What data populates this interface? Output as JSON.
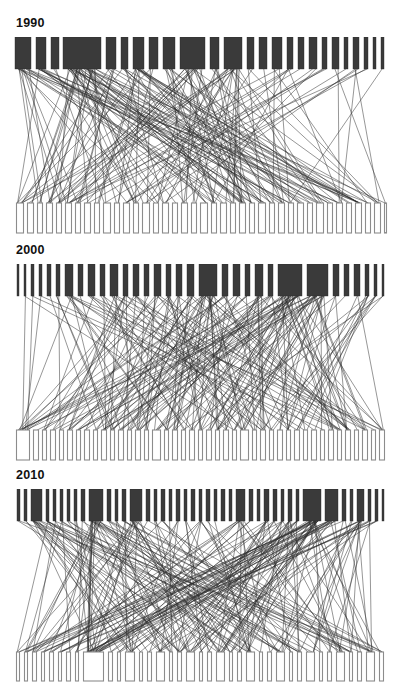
{
  "figure": {
    "title": "",
    "background_color": "#ffffff",
    "width": 400,
    "height": 683,
    "node_top_color": "#3a3a3a",
    "node_bottom_color": "#ffffff",
    "node_bottom_stroke": "#8c8c8c",
    "link_color": "#2f2f2f"
  },
  "chart_data": {
    "type": "diagram",
    "subtype": "bipartite-network",
    "title": "",
    "xlabel": "",
    "ylabel": "",
    "grid": false,
    "legend": null,
    "panel_labels": [
      "1990",
      "2000",
      "2010"
    ],
    "panels": [
      {
        "label": "1990",
        "label_x": 16,
        "label_y": 16,
        "plot": {
          "x": 15,
          "y": 37,
          "width": 371,
          "height": 196
        },
        "top_row": {
          "y": 37,
          "height": 32
        },
        "bottom_row": {
          "y": 203,
          "height": 30
        },
        "top_nodes": [
          {
            "x": 15,
            "w": 16
          },
          {
            "x": 36,
            "w": 10
          },
          {
            "x": 51,
            "w": 8
          },
          {
            "x": 63,
            "w": 38
          },
          {
            "x": 106,
            "w": 10
          },
          {
            "x": 121,
            "w": 7
          },
          {
            "x": 133,
            "w": 11
          },
          {
            "x": 149,
            "w": 9
          },
          {
            "x": 163,
            "w": 12
          },
          {
            "x": 180,
            "w": 25
          },
          {
            "x": 210,
            "w": 9
          },
          {
            "x": 224,
            "w": 18
          },
          {
            "x": 247,
            "w": 7
          },
          {
            "x": 259,
            "w": 8
          },
          {
            "x": 272,
            "w": 10
          },
          {
            "x": 287,
            "w": 6
          },
          {
            "x": 298,
            "w": 6
          },
          {
            "x": 309,
            "w": 8
          },
          {
            "x": 322,
            "w": 5
          },
          {
            "x": 332,
            "w": 7
          },
          {
            "x": 344,
            "w": 4
          },
          {
            "x": 353,
            "w": 6
          },
          {
            "x": 364,
            "w": 4
          },
          {
            "x": 373,
            "w": 3
          },
          {
            "x": 381,
            "w": 3
          }
        ],
        "bottom_nodes": [
          {
            "x": 16,
            "w": 8
          },
          {
            "x": 27,
            "w": 7
          },
          {
            "x": 37,
            "w": 6
          },
          {
            "x": 46,
            "w": 7
          },
          {
            "x": 56,
            "w": 6
          },
          {
            "x": 65,
            "w": 7
          },
          {
            "x": 75,
            "w": 6
          },
          {
            "x": 84,
            "w": 7
          },
          {
            "x": 94,
            "w": 6
          },
          {
            "x": 103,
            "w": 8
          },
          {
            "x": 114,
            "w": 6
          },
          {
            "x": 123,
            "w": 7
          },
          {
            "x": 133,
            "w": 6
          },
          {
            "x": 142,
            "w": 8
          },
          {
            "x": 153,
            "w": 6
          },
          {
            "x": 162,
            "w": 7
          },
          {
            "x": 172,
            "w": 6
          },
          {
            "x": 181,
            "w": 7
          },
          {
            "x": 191,
            "w": 6
          },
          {
            "x": 200,
            "w": 8
          },
          {
            "x": 211,
            "w": 6
          },
          {
            "x": 220,
            "w": 7
          },
          {
            "x": 230,
            "w": 6
          },
          {
            "x": 239,
            "w": 7
          },
          {
            "x": 249,
            "w": 6
          },
          {
            "x": 258,
            "w": 8
          },
          {
            "x": 269,
            "w": 6
          },
          {
            "x": 278,
            "w": 7
          },
          {
            "x": 288,
            "w": 6
          },
          {
            "x": 297,
            "w": 7
          },
          {
            "x": 307,
            "w": 6
          },
          {
            "x": 316,
            "w": 8
          },
          {
            "x": 327,
            "w": 6
          },
          {
            "x": 336,
            "w": 7
          },
          {
            "x": 346,
            "w": 6
          },
          {
            "x": 355,
            "w": 7
          },
          {
            "x": 365,
            "w": 6
          },
          {
            "x": 374,
            "w": 7
          },
          {
            "x": 384,
            "w": 3
          }
        ],
        "links": 190,
        "link_seed": 11
      },
      {
        "label": "2000",
        "label_x": 16,
        "label_y": 243,
        "plot": {
          "x": 15,
          "y": 264,
          "width": 371,
          "height": 196
        },
        "top_row": {
          "y": 264,
          "height": 32
        },
        "bottom_row": {
          "y": 430,
          "height": 30
        },
        "top_nodes": [
          {
            "x": 17,
            "w": 2
          },
          {
            "x": 24,
            "w": 2
          },
          {
            "x": 31,
            "w": 3
          },
          {
            "x": 39,
            "w": 3
          },
          {
            "x": 47,
            "w": 4
          },
          {
            "x": 56,
            "w": 4
          },
          {
            "x": 65,
            "w": 8
          },
          {
            "x": 78,
            "w": 5
          },
          {
            "x": 88,
            "w": 7
          },
          {
            "x": 100,
            "w": 5
          },
          {
            "x": 110,
            "w": 8
          },
          {
            "x": 123,
            "w": 5
          },
          {
            "x": 133,
            "w": 6
          },
          {
            "x": 144,
            "w": 5
          },
          {
            "x": 154,
            "w": 7
          },
          {
            "x": 166,
            "w": 5
          },
          {
            "x": 176,
            "w": 6
          },
          {
            "x": 187,
            "w": 7
          },
          {
            "x": 199,
            "w": 18
          },
          {
            "x": 222,
            "w": 6
          },
          {
            "x": 233,
            "w": 7
          },
          {
            "x": 245,
            "w": 5
          },
          {
            "x": 255,
            "w": 8
          },
          {
            "x": 268,
            "w": 5
          },
          {
            "x": 278,
            "w": 24
          },
          {
            "x": 307,
            "w": 21
          },
          {
            "x": 333,
            "w": 6
          },
          {
            "x": 344,
            "w": 5
          },
          {
            "x": 354,
            "w": 6
          },
          {
            "x": 365,
            "w": 4
          },
          {
            "x": 374,
            "w": 3
          },
          {
            "x": 382,
            "w": 2
          }
        ],
        "bottom_nodes": [
          {
            "x": 16,
            "w": 14
          },
          {
            "x": 33,
            "w": 6
          },
          {
            "x": 42,
            "w": 5
          },
          {
            "x": 50,
            "w": 6
          },
          {
            "x": 59,
            "w": 5
          },
          {
            "x": 67,
            "w": 6
          },
          {
            "x": 76,
            "w": 5
          },
          {
            "x": 84,
            "w": 6
          },
          {
            "x": 93,
            "w": 5
          },
          {
            "x": 101,
            "w": 6
          },
          {
            "x": 110,
            "w": 5
          },
          {
            "x": 118,
            "w": 6
          },
          {
            "x": 127,
            "w": 5
          },
          {
            "x": 135,
            "w": 6
          },
          {
            "x": 144,
            "w": 5
          },
          {
            "x": 152,
            "w": 9
          },
          {
            "x": 164,
            "w": 5
          },
          {
            "x": 172,
            "w": 6
          },
          {
            "x": 181,
            "w": 5
          },
          {
            "x": 189,
            "w": 6
          },
          {
            "x": 198,
            "w": 5
          },
          {
            "x": 206,
            "w": 6
          },
          {
            "x": 215,
            "w": 5
          },
          {
            "x": 223,
            "w": 6
          },
          {
            "x": 232,
            "w": 5
          },
          {
            "x": 240,
            "w": 9
          },
          {
            "x": 252,
            "w": 5
          },
          {
            "x": 260,
            "w": 6
          },
          {
            "x": 269,
            "w": 5
          },
          {
            "x": 277,
            "w": 6
          },
          {
            "x": 286,
            "w": 5
          },
          {
            "x": 294,
            "w": 6
          },
          {
            "x": 303,
            "w": 5
          },
          {
            "x": 311,
            "w": 6
          },
          {
            "x": 320,
            "w": 5
          },
          {
            "x": 328,
            "w": 6
          },
          {
            "x": 337,
            "w": 5
          },
          {
            "x": 345,
            "w": 6
          },
          {
            "x": 354,
            "w": 5
          },
          {
            "x": 362,
            "w": 6
          },
          {
            "x": 371,
            "w": 5
          },
          {
            "x": 379,
            "w": 6
          }
        ],
        "links": 215,
        "link_seed": 29
      },
      {
        "label": "2010",
        "label_x": 16,
        "label_y": 468,
        "plot": {
          "x": 15,
          "y": 489,
          "width": 371,
          "height": 196
        },
        "top_row": {
          "y": 489,
          "height": 32
        },
        "bottom_row": {
          "y": 652,
          "height": 29
        },
        "top_nodes": [
          {
            "x": 17,
            "w": 3
          },
          {
            "x": 24,
            "w": 3
          },
          {
            "x": 31,
            "w": 11
          },
          {
            "x": 46,
            "w": 3
          },
          {
            "x": 53,
            "w": 3
          },
          {
            "x": 60,
            "w": 3
          },
          {
            "x": 67,
            "w": 3
          },
          {
            "x": 74,
            "w": 3
          },
          {
            "x": 81,
            "w": 4
          },
          {
            "x": 89,
            "w": 14
          },
          {
            "x": 107,
            "w": 4
          },
          {
            "x": 115,
            "w": 3
          },
          {
            "x": 122,
            "w": 4
          },
          {
            "x": 130,
            "w": 12
          },
          {
            "x": 146,
            "w": 4
          },
          {
            "x": 154,
            "w": 3
          },
          {
            "x": 161,
            "w": 4
          },
          {
            "x": 169,
            "w": 3
          },
          {
            "x": 176,
            "w": 4
          },
          {
            "x": 184,
            "w": 3
          },
          {
            "x": 191,
            "w": 4
          },
          {
            "x": 199,
            "w": 3
          },
          {
            "x": 206,
            "w": 4
          },
          {
            "x": 214,
            "w": 3
          },
          {
            "x": 221,
            "w": 4
          },
          {
            "x": 229,
            "w": 3
          },
          {
            "x": 236,
            "w": 9
          },
          {
            "x": 249,
            "w": 4
          },
          {
            "x": 257,
            "w": 3
          },
          {
            "x": 264,
            "w": 5
          },
          {
            "x": 273,
            "w": 4
          },
          {
            "x": 281,
            "w": 3
          },
          {
            "x": 288,
            "w": 4
          },
          {
            "x": 296,
            "w": 3
          },
          {
            "x": 303,
            "w": 18
          },
          {
            "x": 325,
            "w": 13
          },
          {
            "x": 342,
            "w": 4
          },
          {
            "x": 350,
            "w": 3
          },
          {
            "x": 357,
            "w": 7
          },
          {
            "x": 368,
            "w": 3
          },
          {
            "x": 375,
            "w": 3
          },
          {
            "x": 382,
            "w": 2
          }
        ],
        "bottom_nodes": [
          {
            "x": 16,
            "w": 4
          },
          {
            "x": 24,
            "w": 4
          },
          {
            "x": 32,
            "w": 5
          },
          {
            "x": 41,
            "w": 4
          },
          {
            "x": 49,
            "w": 5
          },
          {
            "x": 58,
            "w": 4
          },
          {
            "x": 66,
            "w": 5
          },
          {
            "x": 75,
            "w": 4
          },
          {
            "x": 83,
            "w": 21
          },
          {
            "x": 108,
            "w": 5
          },
          {
            "x": 117,
            "w": 4
          },
          {
            "x": 125,
            "w": 10
          },
          {
            "x": 139,
            "w": 4
          },
          {
            "x": 147,
            "w": 5
          },
          {
            "x": 156,
            "w": 9
          },
          {
            "x": 169,
            "w": 4
          },
          {
            "x": 177,
            "w": 5
          },
          {
            "x": 186,
            "w": 9
          },
          {
            "x": 199,
            "w": 4
          },
          {
            "x": 207,
            "w": 5
          },
          {
            "x": 216,
            "w": 9
          },
          {
            "x": 229,
            "w": 4
          },
          {
            "x": 237,
            "w": 5
          },
          {
            "x": 246,
            "w": 9
          },
          {
            "x": 259,
            "w": 4
          },
          {
            "x": 267,
            "w": 5
          },
          {
            "x": 276,
            "w": 9
          },
          {
            "x": 289,
            "w": 4
          },
          {
            "x": 297,
            "w": 5
          },
          {
            "x": 306,
            "w": 9
          },
          {
            "x": 319,
            "w": 4
          },
          {
            "x": 327,
            "w": 5
          },
          {
            "x": 336,
            "w": 9
          },
          {
            "x": 349,
            "w": 4
          },
          {
            "x": 357,
            "w": 5
          },
          {
            "x": 366,
            "w": 9
          },
          {
            "x": 379,
            "w": 5
          }
        ],
        "links": 230,
        "link_seed": 47
      }
    ]
  }
}
